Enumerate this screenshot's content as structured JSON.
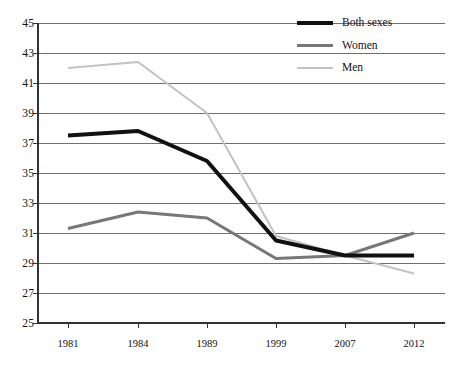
{
  "chart_data": {
    "type": "line",
    "title": "",
    "subtitle": "",
    "xlabel": "",
    "ylabel": "",
    "categories": [
      "1981",
      "1984",
      "1989",
      "1999",
      "2007",
      "2012"
    ],
    "x": [
      1981,
      1984,
      1989,
      1999,
      2007,
      2012
    ],
    "ylim": [
      25,
      45
    ],
    "yticks": [
      25,
      27,
      29,
      31,
      33,
      35,
      37,
      39,
      41,
      43,
      45
    ],
    "ytick_labels": [
      "25",
      "27",
      "29",
      "31",
      "33",
      "35",
      "37",
      "39",
      "41",
      "43",
      "45"
    ],
    "grid": "horizontal",
    "legend_position": "top-right",
    "series": [
      {
        "name": "Both sexes",
        "color": "#111111",
        "width": 4,
        "values": [
          37.5,
          37.8,
          35.8,
          30.5,
          29.5,
          29.5
        ]
      },
      {
        "name": "Women",
        "color": "#777777",
        "width": 3,
        "values": [
          31.3,
          32.4,
          32.0,
          29.3,
          29.5,
          31.0
        ]
      },
      {
        "name": "Men",
        "color": "#c2c2c2",
        "width": 2,
        "values": [
          42.0,
          42.4,
          39.0,
          30.8,
          29.5,
          28.3
        ]
      }
    ]
  },
  "legend": {
    "items": [
      {
        "label": "Both sexes",
        "swatch": "legend-swatch-both-sexes"
      },
      {
        "label": "Women",
        "swatch": "legend-swatch-women"
      },
      {
        "label": "Men",
        "swatch": "legend-swatch-men"
      }
    ]
  },
  "axes": {
    "y_labels": [
      "45",
      "43",
      "41",
      "39",
      "37",
      "35",
      "33",
      "31",
      "29",
      "27",
      "25"
    ],
    "x_labels": [
      "1981",
      "1984",
      "1989",
      "1999",
      "2007",
      "2012"
    ]
  },
  "colors": {
    "both_sexes": "#111111",
    "women": "#777777",
    "men": "#c2c2c2",
    "axis": "#333333",
    "grid": "#6f6f6f",
    "background": "#ffffff"
  }
}
